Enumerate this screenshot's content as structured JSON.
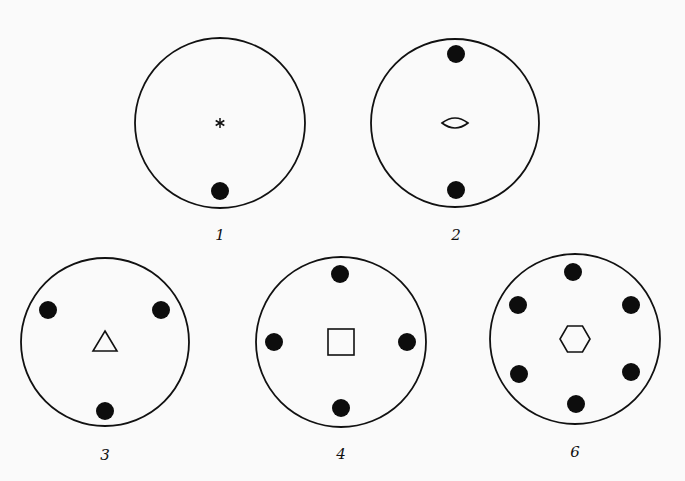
{
  "figure": {
    "background": "#fafafa",
    "stroke_color": "#111111",
    "dot_color": "#0d0d0d",
    "panels": [
      {
        "label": "1",
        "fold": 1,
        "center_symbol": "asterisk",
        "circle": {
          "cx": 220,
          "cy": 123,
          "r": 85
        },
        "label_pos": {
          "x": 220,
          "y": 240
        },
        "dots": [
          [
            220,
            191
          ]
        ]
      },
      {
        "label": "2",
        "fold": 2,
        "center_symbol": "lens",
        "circle": {
          "cx": 455,
          "cy": 123,
          "r": 84
        },
        "label_pos": {
          "x": 456,
          "y": 240
        },
        "dots": [
          [
            456,
            54
          ],
          [
            456,
            190
          ]
        ]
      },
      {
        "label": "3",
        "fold": 3,
        "center_symbol": "triangle",
        "circle": {
          "cx": 105,
          "cy": 342,
          "r": 84
        },
        "label_pos": {
          "x": 105,
          "y": 460
        },
        "dots": [
          [
            48,
            310
          ],
          [
            161,
            310
          ],
          [
            105,
            411
          ]
        ]
      },
      {
        "label": "4",
        "fold": 4,
        "center_symbol": "square",
        "circle": {
          "cx": 341,
          "cy": 342,
          "r": 85
        },
        "label_pos": {
          "x": 341,
          "y": 459
        },
        "dots": [
          [
            340,
            274
          ],
          [
            274,
            342
          ],
          [
            407,
            342
          ],
          [
            341,
            408
          ]
        ]
      },
      {
        "label": "6",
        "fold": 6,
        "center_symbol": "hexagon",
        "circle": {
          "cx": 575,
          "cy": 339,
          "r": 85
        },
        "label_pos": {
          "x": 575,
          "y": 457
        },
        "dots": [
          [
            573,
            272
          ],
          [
            518,
            305
          ],
          [
            631,
            305
          ],
          [
            519,
            374
          ],
          [
            631,
            372
          ],
          [
            576,
            404
          ]
        ]
      }
    ]
  }
}
